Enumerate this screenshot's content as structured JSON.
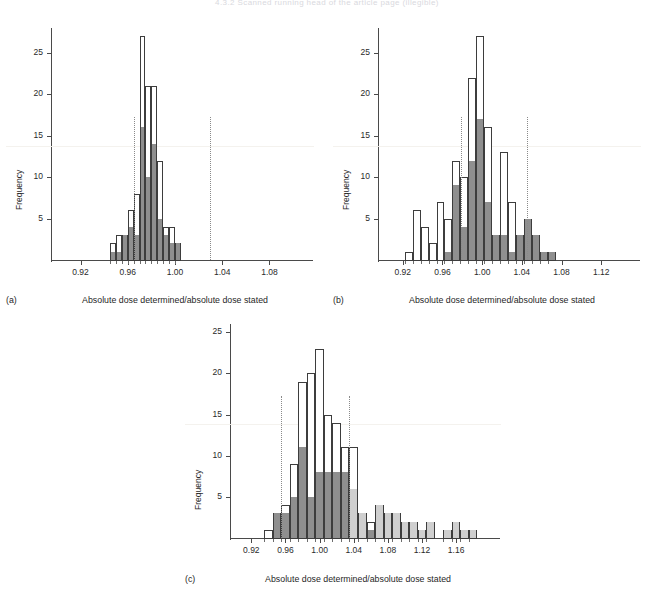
{
  "page": {
    "header_text": "4.3.2  Scanned running head of the article page (illegible)",
    "background": "#ffffff",
    "figure_caption_label": ""
  },
  "style": {
    "dark_fill": "#8f8f8f",
    "light_fill": "#cfcfcf",
    "outline": "#3d3d3d",
    "axis": "#4a4a4a",
    "ref_line": "#8a8a8a"
  },
  "chart_data": [
    {
      "id": "panel-a",
      "type": "bar",
      "panel_tag": "(a)",
      "title": "",
      "xlabel": "Absolute dose determined/absolute dose stated",
      "ylabel": "Frequency",
      "xlim": [
        0.895,
        1.105
      ],
      "ylim": [
        0,
        28
      ],
      "xticks": [
        0.92,
        0.96,
        1.0,
        1.04,
        1.08
      ],
      "xtick_labels": [
        "0.92",
        "0.96",
        "1.00",
        "1.04",
        "1.08"
      ],
      "yticks": [
        5,
        10,
        15,
        20,
        25
      ],
      "ytick_labels": [
        "5",
        "10",
        "15",
        "20",
        "25"
      ],
      "bin_width": 0.005,
      "grid": false,
      "legend": "none",
      "reference_lines": [
        0.965,
        1.03
      ],
      "bins": [
        {
          "x": 0.945,
          "total": 2,
          "dark": 1
        },
        {
          "x": 0.95,
          "total": 3,
          "dark": 1
        },
        {
          "x": 0.955,
          "total": 3,
          "dark": 3
        },
        {
          "x": 0.96,
          "total": 6,
          "dark": 4
        },
        {
          "x": 0.965,
          "total": 8,
          "dark": 3
        },
        {
          "x": 0.97,
          "total": 27,
          "dark": 16
        },
        {
          "x": 0.975,
          "total": 21,
          "dark": 10
        },
        {
          "x": 0.98,
          "total": 21,
          "dark": 14
        },
        {
          "x": 0.985,
          "total": 12,
          "dark": 5
        },
        {
          "x": 0.99,
          "total": 4,
          "dark": 3
        },
        {
          "x": 0.995,
          "total": 4,
          "dark": 2
        },
        {
          "x": 1.0,
          "total": 2,
          "dark": 2
        }
      ],
      "bin_x_positions": [
        0.945,
        0.95,
        0.955,
        0.96,
        0.965,
        0.9725,
        0.9775,
        0.9825,
        0.9875,
        1.0275,
        1.0325,
        1.0375
      ],
      "note": "bars span roughly 0.945 to 1.055 on the axis"
    },
    {
      "id": "panel-b",
      "type": "bar",
      "panel_tag": "(b)",
      "title": "",
      "xlabel": "Absolute dose determined/absolute dose stated",
      "ylabel": "Frequency",
      "xlim": [
        0.895,
        1.145
      ],
      "ylim": [
        0,
        28
      ],
      "xticks": [
        0.92,
        0.96,
        1.0,
        1.04,
        1.08,
        1.12
      ],
      "xtick_labels": [
        "0.92",
        "0.96",
        "1.00",
        "1.04",
        "1.08",
        "1.12"
      ],
      "yticks": [
        5,
        10,
        15,
        20,
        25
      ],
      "ytick_labels": [
        "5",
        "10",
        "15",
        "20",
        "25"
      ],
      "bin_width": 0.008,
      "grid": false,
      "legend": "none",
      "reference_lines": [
        0.979,
        1.045
      ],
      "bins": [
        {
          "x": 0.922,
          "total": 1,
          "dark": 0
        },
        {
          "x": 0.93,
          "total": 6,
          "dark": 0
        },
        {
          "x": 0.938,
          "total": 4,
          "dark": 0
        },
        {
          "x": 0.946,
          "total": 2,
          "dark": 0
        },
        {
          "x": 0.954,
          "total": 7,
          "dark": 0
        },
        {
          "x": 0.962,
          "total": 5,
          "dark": 1
        },
        {
          "x": 0.97,
          "total": 12,
          "dark": 9
        },
        {
          "x": 0.978,
          "total": 10,
          "dark": 4
        },
        {
          "x": 0.986,
          "total": 22,
          "dark": 12
        },
        {
          "x": 0.994,
          "total": 27,
          "dark": 17
        },
        {
          "x": 1.002,
          "total": 16,
          "dark": 7
        },
        {
          "x": 1.01,
          "total": 3,
          "dark": 3
        },
        {
          "x": 1.018,
          "total": 13,
          "dark": 3
        },
        {
          "x": 1.026,
          "total": 7,
          "dark": 1
        },
        {
          "x": 1.034,
          "total": 3,
          "dark": 3
        },
        {
          "x": 1.042,
          "total": 5,
          "dark": 5
        },
        {
          "x": 1.05,
          "total": 3,
          "dark": 3
        },
        {
          "x": 1.058,
          "total": 1,
          "dark": 1
        },
        {
          "x": 1.066,
          "total": 1,
          "dark": 1
        }
      ]
    },
    {
      "id": "panel-c",
      "type": "bar",
      "panel_tag": "(c)",
      "title": "",
      "xlabel": "Absolute dose determined/absolute dose stated",
      "ylabel": "Frequency",
      "xlim": [
        0.895,
        1.195
      ],
      "ylim": [
        0,
        26
      ],
      "xticks": [
        0.92,
        0.96,
        1.0,
        1.04,
        1.08,
        1.12,
        1.16
      ],
      "xtick_labels": [
        "0.92",
        "0.96",
        "1.00",
        "1.04",
        "1.08",
        "1.12",
        "1.16"
      ],
      "yticks": [
        5,
        10,
        15,
        20,
        25
      ],
      "ytick_labels": [
        "5",
        "10",
        "15",
        "20",
        "25"
      ],
      "bin_width": 0.01,
      "grid": false,
      "legend": "none",
      "reference_lines": [
        0.955,
        1.035
      ],
      "bins": [
        {
          "x": 0.935,
          "total": 1,
          "dark": 0,
          "light": 0
        },
        {
          "x": 0.945,
          "total": 3,
          "dark": 3,
          "light": 0
        },
        {
          "x": 0.955,
          "total": 4,
          "dark": 3,
          "light": 0
        },
        {
          "x": 0.965,
          "total": 9,
          "dark": 5,
          "light": 0
        },
        {
          "x": 0.975,
          "total": 19,
          "dark": 11,
          "light": 0
        },
        {
          "x": 0.985,
          "total": 20,
          "dark": 5,
          "light": 0
        },
        {
          "x": 0.995,
          "total": 23,
          "dark": 8,
          "light": 0
        },
        {
          "x": 1.005,
          "total": 15,
          "dark": 8,
          "light": 0
        },
        {
          "x": 1.015,
          "total": 14,
          "dark": 8,
          "light": 1
        },
        {
          "x": 1.025,
          "total": 11,
          "dark": 8,
          "light": 0
        },
        {
          "x": 1.035,
          "total": 11,
          "dark": 0,
          "light": 6
        },
        {
          "x": 1.045,
          "total": 3,
          "dark": 0,
          "light": 3
        },
        {
          "x": 1.055,
          "total": 2,
          "dark": 1,
          "light": 1
        },
        {
          "x": 1.065,
          "total": 4,
          "dark": 0,
          "light": 4
        },
        {
          "x": 1.075,
          "total": 3,
          "dark": 0,
          "light": 3
        },
        {
          "x": 1.085,
          "total": 3,
          "dark": 0,
          "light": 3
        },
        {
          "x": 1.095,
          "total": 2,
          "dark": 0,
          "light": 2
        },
        {
          "x": 1.105,
          "total": 2,
          "dark": 0,
          "light": 2
        },
        {
          "x": 1.115,
          "total": 1,
          "dark": 0,
          "light": 1
        },
        {
          "x": 1.125,
          "total": 2,
          "dark": 0,
          "light": 2
        },
        {
          "x": 1.145,
          "total": 1,
          "dark": 0,
          "light": 1
        },
        {
          "x": 1.155,
          "total": 2,
          "dark": 0,
          "light": 2
        },
        {
          "x": 1.165,
          "total": 1,
          "dark": 0,
          "light": 1
        },
        {
          "x": 1.175,
          "total": 1,
          "dark": 0,
          "light": 1
        }
      ]
    }
  ]
}
